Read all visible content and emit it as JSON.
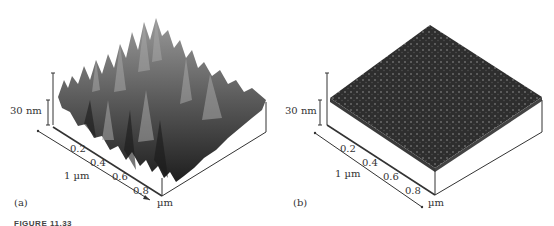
{
  "figure": {
    "caption": "FIGURE 11.33",
    "panels": [
      {
        "id": "a",
        "label": "(a)",
        "z_scale": "30 nm",
        "lateral_scale": "1 µm",
        "axis_unit": "µm",
        "ticks": [
          "0.2",
          "0.4",
          "0.6",
          "0.8"
        ],
        "surface": "rough, tall peaks"
      },
      {
        "id": "b",
        "label": "(b)",
        "z_scale": "30 nm",
        "lateral_scale": "1 µm",
        "axis_unit": "µm",
        "ticks": [
          "0.2",
          "0.4",
          "0.6",
          "0.8"
        ],
        "surface": "smooth, fine grains"
      }
    ]
  },
  "colors": {
    "surface_dark": "#2a2a2a",
    "surface_light": "#8a8a8a",
    "axis": "#333333"
  }
}
